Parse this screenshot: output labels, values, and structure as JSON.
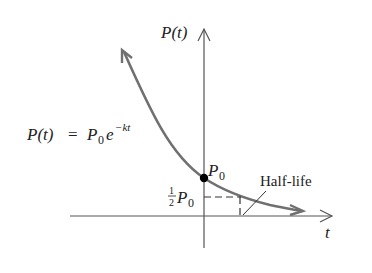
{
  "diagram": {
    "axes": {
      "x_label": "t",
      "y_label": "P(t)"
    },
    "equation": {
      "lhs": "P(t)",
      "eq": "=",
      "base": "P",
      "base_sub": "0",
      "exp_base": "e",
      "exponent": "−kt"
    },
    "points": {
      "initial": {
        "label": "P",
        "sub": "0"
      },
      "half": {
        "frac_num": "1",
        "frac_den": "2",
        "label": "P",
        "sub": "0"
      }
    },
    "annotation": "Half-life",
    "colors": {
      "curve": "#707070",
      "axes": "#555555",
      "point": "#000000",
      "text": "#222222"
    }
  }
}
